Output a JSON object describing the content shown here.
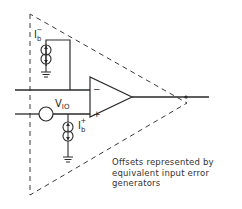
{
  "diagram": {
    "labels": {
      "ib_minus_main": "I",
      "ib_minus_sub": "b",
      "ib_minus_sup": "−",
      "ib_plus_main": "I",
      "ib_plus_sub": "b",
      "ib_plus_sup": "+",
      "vio_main": "V",
      "vio_sub": "IO",
      "inverting_input": "−",
      "noninverting_input": "+"
    },
    "caption": {
      "lines": [
        "Offsets represented by",
        "equivalent input error",
        "generators"
      ]
    },
    "colors": {
      "line": "#2a2a2a",
      "dashed": "#3a3a3a",
      "background": "#ffffff"
    }
  }
}
